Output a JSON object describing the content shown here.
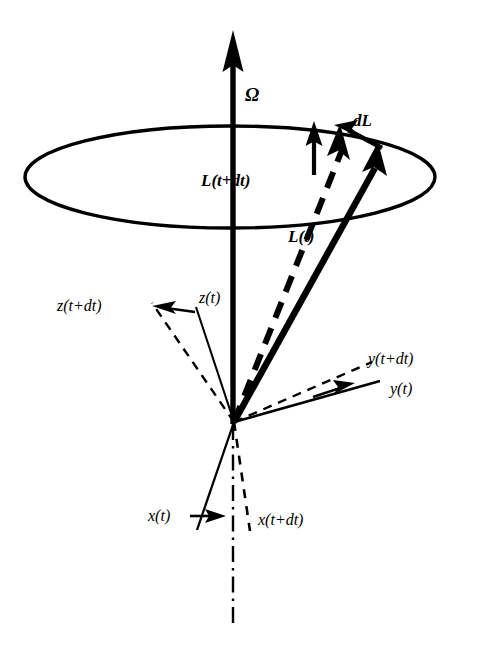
{
  "figure": {
    "corner_mark": "",
    "background_color": "#ffffff",
    "stroke_color": "#000000",
    "width": 485,
    "height": 646
  },
  "labels": {
    "omega": "Ω",
    "dL": "dL",
    "L_t_dt": "L(t+dt)",
    "L_t": "L(t)",
    "z_t_dt": "z(t+dt)",
    "z_t": "z(t)",
    "y_t_dt": "y(t+dt)",
    "y_t": "y(t)",
    "x_t": "x(t)",
    "x_t_dt": "x(t+dt)"
  },
  "elements": {
    "precession_cone_circle": "ellipse",
    "rotation_axis": "vertical-arrow",
    "angular_momentum_current": "L(t) solid arrow",
    "angular_momentum_next": "L(t+dt) dashed arrow",
    "momentum_change": "dL arrow",
    "body_axes_current": [
      "x(t)",
      "y(t)",
      "z(t)"
    ],
    "body_axes_next": [
      "x(t+dt)",
      "y(t+dt)",
      "z(t+dt)"
    ],
    "symmetry_axis": "dash-dot vertical line"
  },
  "geometry": {
    "origin": {
      "x": 234,
      "y": 422
    },
    "ellipse": {
      "cx": 230,
      "cy": 177,
      "rx": 205,
      "ry": 51
    },
    "omega_arrow": {
      "x1": 233,
      "y1": 230,
      "x2": 233,
      "y2": 32
    },
    "L_t_tip": {
      "x": 377,
      "y": 147
    },
    "L_t_dt_tip": {
      "x": 341,
      "y": 132
    },
    "dL_arrow": {
      "x1": 380,
      "y1": 145,
      "x2": 338,
      "y2": 127
    }
  }
}
